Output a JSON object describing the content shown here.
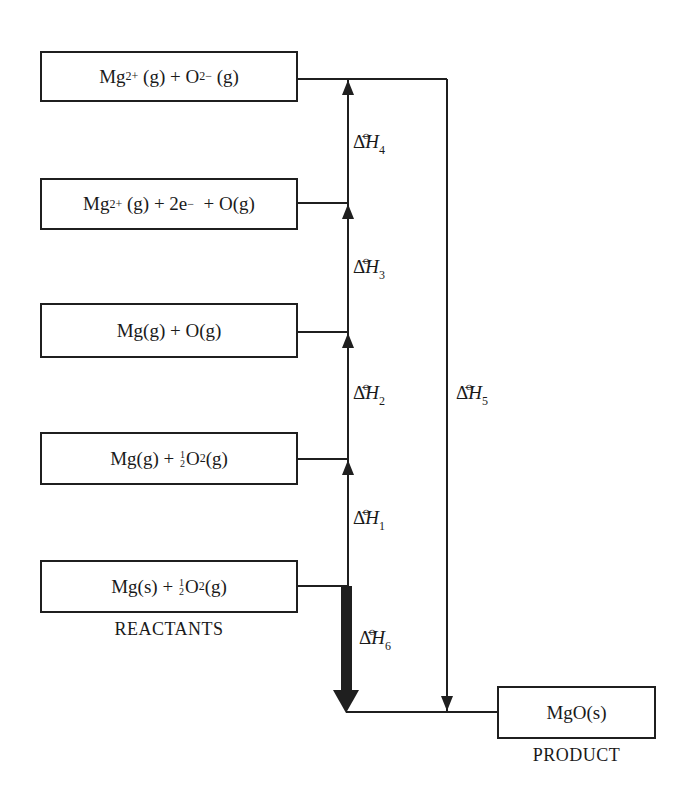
{
  "diagram": {
    "type": "Born-Haber energy cycle",
    "colors": {
      "line": "#1f1f1f",
      "background": "#ffffff"
    },
    "boxes": [
      {
        "id": "box-mg2-o2-gas",
        "parts": [
          "Mg",
          "2+",
          " (g) + O",
          "2−",
          " (g)"
        ],
        "text": "Mg2+ (g) + O2− (g)"
      },
      {
        "id": "box-mg2-2e-o-gas",
        "parts": [
          "Mg",
          "2+",
          " (g) + 2e",
          "−",
          "  + O(g)"
        ],
        "text": "Mg2+ (g) + 2e− + O(g)"
      },
      {
        "id": "box-mg-o-gas",
        "text": "Mg(g) + O(g)"
      },
      {
        "id": "box-mg-gas-half-o2",
        "parts": [
          "Mg(g) + ",
          "1",
          "2",
          "O",
          "2",
          "(g)"
        ],
        "text": "Mg(g) + ½O2(g)"
      },
      {
        "id": "box-reactants",
        "parts": [
          "Mg(s) + ",
          "1",
          "2",
          "O",
          "2",
          "(g)"
        ],
        "text": "Mg(s) + ½O2(g)"
      },
      {
        "id": "box-product",
        "text": "MgO(s)"
      }
    ],
    "captions": {
      "reactants": "REACTANTS",
      "product": "PRODUCT"
    },
    "enthalpy_labels": [
      {
        "id": "dh1",
        "delta": "Δ",
        "symbol": "H",
        "subscript": "1",
        "standard": "⦵",
        "direction": "up",
        "from": "Mg(s) + ½O2(g)",
        "to": "Mg(g) + ½O2(g)"
      },
      {
        "id": "dh2",
        "delta": "Δ",
        "symbol": "H",
        "subscript": "2",
        "standard": "⦵",
        "direction": "up",
        "from": "Mg(g) + ½O2(g)",
        "to": "Mg(g) + O(g)"
      },
      {
        "id": "dh3",
        "delta": "Δ",
        "symbol": "H",
        "subscript": "3",
        "standard": "⦵",
        "direction": "up",
        "from": "Mg(g) + O(g)",
        "to": "Mg2+ (g) + 2e− + O(g)"
      },
      {
        "id": "dh4",
        "delta": "Δ",
        "symbol": "H",
        "subscript": "4",
        "standard": "⦵",
        "direction": "up",
        "from": "Mg2+ (g) + 2e− + O(g)",
        "to": "Mg2+ (g) + O2− (g)"
      },
      {
        "id": "dh5",
        "delta": "Δ",
        "symbol": "H",
        "subscript": "5",
        "standard": "⦵",
        "direction": "down",
        "from": "Mg2+ (g) + O2− (g)",
        "to": "MgO(s)"
      },
      {
        "id": "dh6",
        "delta": "Δ",
        "symbol": "H",
        "subscript": "6",
        "standard": "⦵",
        "direction": "down",
        "from": "Mg(s) + ½O2(g)",
        "to": "MgO(s)",
        "emphasis": "bold"
      }
    ]
  }
}
